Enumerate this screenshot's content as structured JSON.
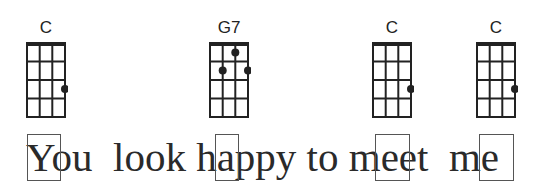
{
  "chords": [
    {
      "name": "C",
      "x": 26,
      "dots": [
        {
          "string": 3,
          "fret": 3
        }
      ]
    },
    {
      "name": "G7",
      "x": 209,
      "dots": [
        {
          "string": 2,
          "fret": 1
        },
        {
          "string": 1,
          "fret": 2
        },
        {
          "string": 3,
          "fret": 2
        }
      ]
    },
    {
      "name": "C",
      "x": 372,
      "dots": [
        {
          "string": 3,
          "fret": 3
        }
      ]
    },
    {
      "name": "C",
      "x": 476,
      "dots": [
        {
          "string": 3,
          "fret": 3
        }
      ]
    }
  ],
  "lyrics": {
    "text": "You  look happy to meet  me",
    "highlights": [
      {
        "letter": "Y",
        "x": 27,
        "w": 34
      },
      {
        "letter": "h",
        "x": 215,
        "w": 24
      },
      {
        "letter": "m",
        "x": 375,
        "w": 35
      },
      {
        "letter": "m",
        "x": 479,
        "w": 35
      }
    ]
  },
  "colors": {
    "ink": "#222222",
    "box": "#555555"
  }
}
